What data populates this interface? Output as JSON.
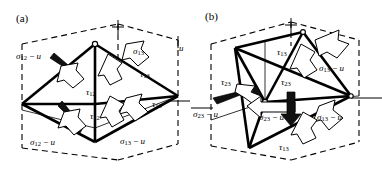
{
  "figure": {
    "type": "engineering-diagram",
    "background": "#ffffff",
    "ink_color": "#000000"
  },
  "panels": [
    {
      "id": "a",
      "tag": "(a)",
      "labels": [
        {
          "name": "sigma-12-minus-u-upper-left",
          "symbol": "σ",
          "sub": "12",
          "suffix": "− u",
          "x": 16,
          "y": 52
        },
        {
          "name": "sigma-13-upper-right",
          "symbol": "σ",
          "sub": "13",
          "suffix": "",
          "x": 133,
          "y": 47
        },
        {
          "name": "u-upper-right",
          "symbol": "",
          "sub": "",
          "suffix": "u",
          "x": 177,
          "y": 45
        },
        {
          "name": "tau-13-upper",
          "symbol": "τ",
          "sub": "13",
          "suffix": "",
          "x": 140,
          "y": 70
        },
        {
          "name": "tau-12-upper",
          "symbol": "τ",
          "sub": "12",
          "suffix": "",
          "x": 86,
          "y": 88
        },
        {
          "name": "tau-12-lower",
          "symbol": "τ",
          "sub": "12",
          "suffix": "",
          "x": 90,
          "y": 112
        },
        {
          "name": "tau-13-lower",
          "symbol": "τ",
          "sub": "13",
          "suffix": "",
          "x": 152,
          "y": 100
        },
        {
          "name": "sigma-12-minus-u-lower-left",
          "symbol": "σ",
          "sub": "12",
          "suffix": "− u",
          "x": 30,
          "y": 138
        },
        {
          "name": "sigma-13-minus-u-lower-right",
          "symbol": "σ",
          "sub": "13",
          "suffix": "− u",
          "x": 120,
          "y": 137
        }
      ]
    },
    {
      "id": "b",
      "tag": "(b)",
      "labels": [
        {
          "name": "tau-13-upper",
          "symbol": "τ",
          "sub": "13",
          "suffix": "",
          "x": 86,
          "y": 48
        },
        {
          "name": "sigma-13-minus-u-upper-right",
          "symbol": "σ",
          "sub": "13",
          "suffix": "− u",
          "x": 128,
          "y": 64
        },
        {
          "name": "tau-23-left",
          "symbol": "τ",
          "sub": "23",
          "suffix": "",
          "x": 30,
          "y": 78
        },
        {
          "name": "tau-23-center",
          "symbol": "τ",
          "sub": "23",
          "suffix": "",
          "x": 90,
          "y": 78
        },
        {
          "name": "sigma-23-minus-u-left",
          "symbol": "σ",
          "sub": "23",
          "suffix": "− u",
          "x": 2,
          "y": 110
        },
        {
          "name": "sigma-23-minus-u-center",
          "symbol": "σ",
          "sub": "23",
          "suffix": "− u",
          "x": 68,
          "y": 113
        },
        {
          "name": "sigma-13-minus-u-right",
          "symbol": "σ",
          "sub": "13",
          "suffix": "− u",
          "x": 126,
          "y": 113
        },
        {
          "name": "tau-13-lower",
          "symbol": "τ",
          "sub": "13",
          "suffix": "",
          "x": 88,
          "y": 143
        }
      ]
    }
  ]
}
